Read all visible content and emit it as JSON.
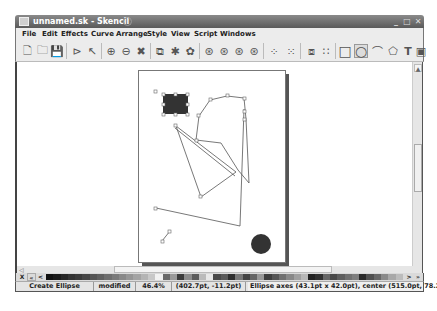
{
  "window": {
    "title": "unnamed.sk - Skencil",
    "controls": {
      "minimize": "_",
      "maximize": "□",
      "close": "✕"
    }
  },
  "menubar": {
    "items": [
      {
        "label": "File"
      },
      {
        "label": "Edit"
      },
      {
        "label": "Effects"
      },
      {
        "label": "Curve"
      },
      {
        "label": "Arrange"
      },
      {
        "label": "Style"
      },
      {
        "label": "View"
      },
      {
        "label": "Script"
      },
      {
        "label": "Windows"
      }
    ]
  },
  "toolbar": {
    "buttons": [
      {
        "name": "new-icon",
        "glyph": "🗋"
      },
      {
        "name": "open-icon",
        "glyph": "🗀"
      },
      {
        "name": "save-icon",
        "glyph": "💾"
      },
      {
        "name": "edit-mode-icon",
        "glyph": "⊳"
      },
      {
        "name": "select-mode-icon",
        "glyph": "↖"
      },
      {
        "name": "zoom-in-icon",
        "glyph": "⊕"
      },
      {
        "name": "zoom-out-icon",
        "glyph": "⊖"
      },
      {
        "name": "fit-icon",
        "glyph": "✖"
      },
      {
        "name": "group-icon",
        "glyph": "⧉"
      },
      {
        "name": "ungroup-icon",
        "glyph": "✱"
      },
      {
        "name": "combine-icon",
        "glyph": "✿"
      },
      {
        "name": "raise-icon",
        "glyph": "⊛"
      },
      {
        "name": "lower-icon",
        "glyph": "⊛"
      },
      {
        "name": "to-top-icon",
        "glyph": "⊛"
      },
      {
        "name": "to-bottom-icon",
        "glyph": "⊛"
      },
      {
        "name": "snap-grid-icon",
        "glyph": "⁘"
      },
      {
        "name": "snap-object-icon",
        "glyph": "⁙"
      },
      {
        "name": "blend-icon",
        "glyph": "⧈"
      },
      {
        "name": "grid-icon",
        "glyph": "∷"
      },
      {
        "name": "rectangle-tool-icon",
        "glyph": "□"
      },
      {
        "name": "ellipse-tool-icon",
        "glyph": "○"
      },
      {
        "name": "freehand-tool-icon",
        "glyph": "⌒"
      },
      {
        "name": "polygon-tool-icon",
        "glyph": "⬠"
      },
      {
        "name": "text-tool-icon",
        "glyph": "T"
      },
      {
        "name": "image-tool-icon",
        "glyph": "▣"
      }
    ]
  },
  "palette": {
    "no_color_label": "X",
    "prev_label": "<",
    "next_label": ">",
    "last_label": "»",
    "swatches": [
      "#111111",
      "#1a1a1a",
      "#262626",
      "#333333",
      "#3b3b3b",
      "#474747",
      "#555555",
      "#606060",
      "#6e6e6e",
      "#7a7a7a",
      "#888888",
      "#969696",
      "#a4a4a4",
      "#b4b4b4",
      "#c8c8c8",
      "#f2f2f2",
      "#6a6a6a",
      "#9a9a9a",
      "#3c3c3c",
      "#8c8c8c",
      "#5c5c5c",
      "#bbbbbb",
      "#e8e8e8",
      "#4a4a4a",
      "#5a5a5a",
      "#2e2e2e",
      "#777777",
      "#444444",
      "#666666",
      "#999999",
      "#3e3e3e",
      "#555555",
      "#707070",
      "#888888",
      "#a0a0a0",
      "#b8b8b8",
      "#222222",
      "#303030",
      "#666666",
      "#4a4a4a",
      "#5e5e5e",
      "#707070",
      "#7e7e7e",
      "#2a2a2a",
      "#505050",
      "#686868",
      "#8a8a8a",
      "#a8a8a8",
      "#bcbcbc"
    ]
  },
  "statusbar": {
    "mode": "Create Ellipse",
    "modified": "modified",
    "zoom": "46.4%",
    "coords": "(402.7pt, -11.2pt)",
    "info": "Ellipse axes (43.1pt x 42.0pt), center (515.0pt, 78.2pt)"
  },
  "colors": {
    "titlebar": "#6e6e6e",
    "chrome": "#ececec",
    "canvas": "#ffffff",
    "shape_fill": "#333333"
  }
}
